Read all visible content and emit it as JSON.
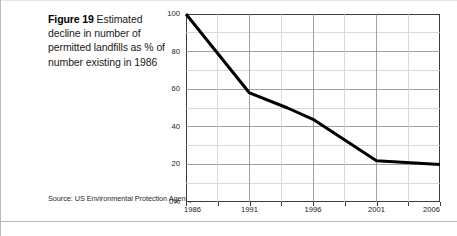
{
  "caption": {
    "lead": "Figure 19",
    "text": " Estimated decline in number of  permitted landfills as % of number existing in 1986"
  },
  "source": {
    "text": "Source: US Environmental Protection Agency"
  },
  "colors": {
    "line": "#000000",
    "frame": "#3c3c3c",
    "grid_major": "#8a8a8a",
    "grid_minor": "#cfcfcf",
    "text": "#1a1a1a",
    "background": "#ffffff"
  },
  "chart_data": {
    "type": "line",
    "title": "",
    "subtitle": "",
    "xlabel": "",
    "ylabel": "",
    "x": [
      1986,
      1991,
      1994,
      1996,
      2001,
      2006
    ],
    "values": [
      100,
      58,
      50,
      44,
      22,
      20
    ],
    "series": [
      {
        "name": "Permitted landfills as % of 1986",
        "values": [
          100,
          58,
          50,
          44,
          22,
          20
        ]
      }
    ],
    "xlim": [
      1986,
      2006
    ],
    "ylim": [
      0,
      100
    ],
    "ytick_values": [
      0,
      20,
      40,
      60,
      80,
      100
    ],
    "ytick_labels": [
      "0%",
      "20",
      "40",
      "60",
      "80",
      "100"
    ],
    "ytick_minor": [
      10,
      30,
      50,
      70,
      90
    ],
    "xtick_values": [
      1986,
      1991,
      1996,
      2001,
      2006
    ],
    "xtick_labels": [
      "1986",
      "1991",
      "1996",
      "2001",
      "2006"
    ],
    "xtick_minor": [
      1988.5,
      1993.5,
      1998.5,
      2003.5
    ],
    "grid": true,
    "legend": false,
    "legend_position": "none"
  }
}
